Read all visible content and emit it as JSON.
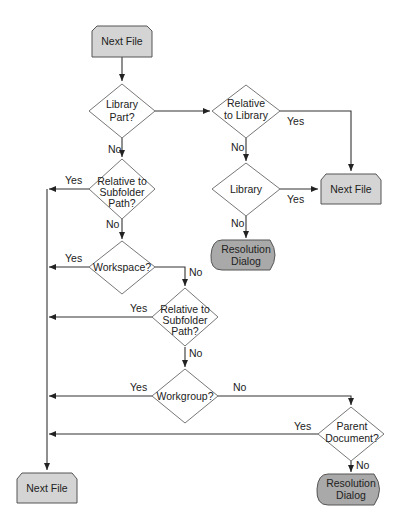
{
  "colors": {
    "process_fill": "#d4d4d4",
    "terminal_fill": "#a9a9a9",
    "decision_fill": "#ffffff",
    "stroke": "#555555",
    "background": "#ffffff"
  },
  "nodes": {
    "start_next_file": {
      "label": "Next File",
      "type": "process"
    },
    "library_part": {
      "lines": [
        "Library",
        "Part?"
      ],
      "type": "decision"
    },
    "relative_to_library": {
      "lines": [
        "Relative",
        "to Library"
      ],
      "type": "decision"
    },
    "next_file_right": {
      "label": "Next File",
      "type": "process"
    },
    "library": {
      "label": "Library",
      "type": "decision"
    },
    "resolution_dialog_middle": {
      "lines": [
        "Resolution",
        "Dialog"
      ],
      "type": "terminal"
    },
    "relative_subfolder_1": {
      "lines": [
        "Relative to",
        "Subfolder",
        "Path?"
      ],
      "type": "decision"
    },
    "workspace": {
      "label": "Workspace?",
      "type": "decision"
    },
    "relative_subfolder_2": {
      "lines": [
        "Relative to",
        "Subfolder",
        "Path?"
      ],
      "type": "decision"
    },
    "workgroup": {
      "label": "Workgroup?",
      "type": "decision"
    },
    "parent_document": {
      "lines": [
        "Parent",
        "Document?"
      ],
      "type": "decision"
    },
    "resolution_dialog_bottom": {
      "lines": [
        "Resolution",
        "Dialog"
      ],
      "type": "terminal"
    },
    "next_file_bottom": {
      "label": "Next File",
      "type": "process"
    }
  },
  "edge_labels": {
    "library_part_no": "No",
    "relative_to_library_yes": "Yes",
    "relative_to_library_no": "No",
    "library_yes": "Yes",
    "library_no": "No",
    "relative_subfolder_1_yes": "Yes",
    "relative_subfolder_1_no": "No",
    "workspace_yes": "Yes",
    "workspace_no": "No",
    "relative_subfolder_2_yes": "Yes",
    "relative_subfolder_2_no": "No",
    "workgroup_yes": "Yes",
    "workgroup_no": "No",
    "parent_document_yes": "Yes",
    "parent_document_no": "No"
  }
}
